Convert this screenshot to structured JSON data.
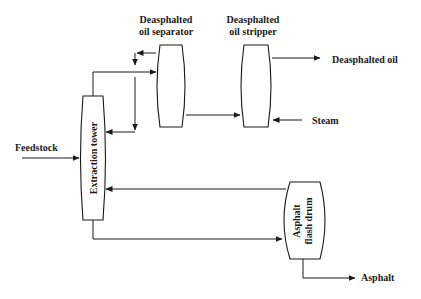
{
  "diagram": {
    "type": "process-flow",
    "units": {
      "extraction_tower": "Extraction tower",
      "separator_line1": "Deasphalted",
      "separator_line2": "oil separator",
      "stripper_line1": "Deasphalted",
      "stripper_line2": "oil stripper",
      "flash_drum_line1": "Asphalt",
      "flash_drum_line2": "flash drum"
    },
    "streams": {
      "feedstock": "Feedstock",
      "deasphalted_oil": "Deasphalted oil",
      "steam": "Steam",
      "asphalt": "Asphalt"
    },
    "colors": {
      "line": "#1a1a1a",
      "background": "#ffffff"
    }
  }
}
